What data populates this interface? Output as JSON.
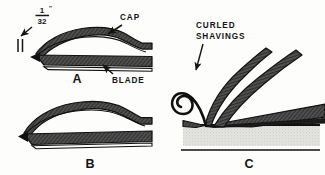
{
  "figure": {
    "background_color": "#fdfdfc",
    "ink_color": "#141414",
    "metal_fill": "#4a4a4a",
    "wood_fill": "#d8d8d4"
  },
  "panels": [
    {
      "id": "A",
      "caption": "A",
      "labels": [
        {
          "name": "cap",
          "text": "CAP"
        },
        {
          "name": "blade",
          "text": "BLADE"
        }
      ],
      "dimension": {
        "numerator": "1",
        "denominator": "32",
        "unit_mark": "″"
      }
    },
    {
      "id": "B",
      "caption": "B",
      "labels": []
    },
    {
      "id": "C",
      "caption": "C",
      "labels": [
        {
          "name": "curled-shavings-line1",
          "text": "CURLED"
        },
        {
          "name": "curled-shavings-line2",
          "text": "SHAVINGS"
        }
      ]
    }
  ]
}
